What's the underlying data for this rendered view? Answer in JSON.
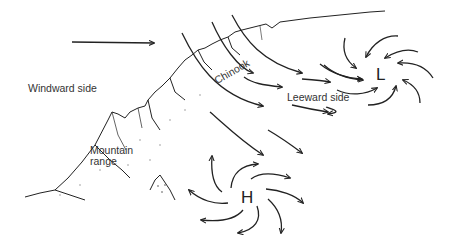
{
  "diagram": {
    "labels": {
      "windward": "Windward side",
      "mountain_line1": "Mountain",
      "mountain_line2": "range",
      "chinook": "Chinook",
      "leeward": "Leeward side"
    },
    "pressure_systems": {
      "low": "L",
      "high": "H"
    },
    "colors": {
      "ink": "#222222",
      "label": "#333333",
      "background": "#ffffff"
    }
  }
}
